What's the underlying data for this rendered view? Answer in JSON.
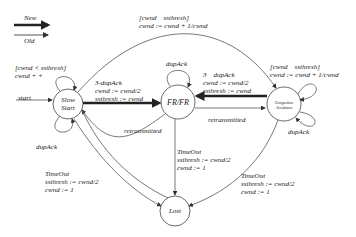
{
  "legend": {
    "new": "New",
    "old": "Old"
  },
  "states": {
    "slow_start": "Slow\nStart",
    "frfr": "FR/FR",
    "ca": "Congestion\nAvoidance",
    "lost": "Lost"
  },
  "transitions": {
    "top_arc": "[cwnd    ssthresh]\ncwnd := cwnd + 1/cwnd",
    "ss_loop": "[cwnd < ssthresh]\ncwnd + +",
    "start": "start",
    "ss_dupack": "dupAck",
    "ss_to_frfr": "3-dupAck\ncwnd := cwnd/2\nssthresh := cwnd",
    "frfr_loop": "dupAck",
    "ca_to_frfr": "3    dupAck\ncwnd := cwnd/2\nssthresh := cwnd",
    "ca_loop": "[cwnd    ssthresh]\ncwnd := cwnd + 1/cwnd",
    "ca_dupack": "dupAck",
    "frfr_to_ss": "retransmitted",
    "frfr_to_ca": "retransmitted",
    "ss_timeout": "TimeOut\nssthresh := cwnd/2\ncwnd := 1",
    "frfr_timeout": "TimeOut\nssthresh := cwnd/2\ncwnd := 1",
    "ca_timeout": "TimeOut\nssthresh := cwnd/2\ncwnd := 1"
  }
}
